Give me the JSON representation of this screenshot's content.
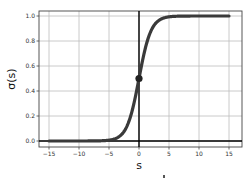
{
  "chart_data": {
    "type": "line",
    "title": "",
    "xlabel": "s",
    "ylabel": "σ(s)",
    "xlim": [
      -16,
      16.5
    ],
    "ylim": [
      -0.05,
      1.07
    ],
    "grid": true,
    "legend": null,
    "x_ticks": [
      "−15",
      "−10",
      "−5",
      "0",
      "5",
      "10",
      "15"
    ],
    "x_tick_values": [
      -15,
      -10,
      -5,
      0,
      5,
      10,
      15
    ],
    "y_ticks": [
      "0.0",
      "0.2",
      "0.4",
      "0.6",
      "0.8",
      "1.0"
    ],
    "y_tick_values": [
      0,
      0.2,
      0.4,
      0.6,
      0.8,
      1.0
    ],
    "series": [
      {
        "name": "sigmoid",
        "function": "1/(1+exp(-s))",
        "x_range": [
          -15,
          15
        ],
        "color": "#3a3a3a",
        "sample_points": [
          {
            "x": -15,
            "y": 0.0
          },
          {
            "x": -5,
            "y": 0.007
          },
          {
            "x": -2,
            "y": 0.12
          },
          {
            "x": 0,
            "y": 0.5
          },
          {
            "x": 2,
            "y": 0.88
          },
          {
            "x": 5,
            "y": 0.993
          },
          {
            "x": 15,
            "y": 1.0
          }
        ]
      }
    ],
    "annotations": [
      {
        "type": "point",
        "x": 0,
        "y": 0.5,
        "color": "#222222"
      },
      {
        "type": "vline",
        "x": 0,
        "color": "#000000"
      },
      {
        "type": "hline",
        "y": 0,
        "color": "#000000"
      }
    ]
  }
}
